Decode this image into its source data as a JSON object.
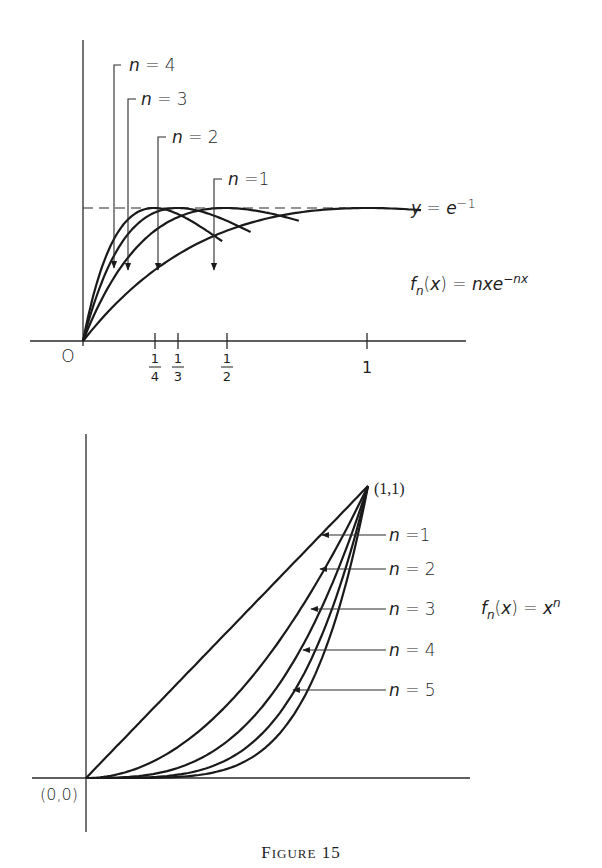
{
  "caption": "Figure 15",
  "top_plot": {
    "formula": "f_n(x) = nxe^{-nx}",
    "formula_parts": {
      "f": "f",
      "sub": "n",
      "rest": "(x) = nxe",
      "sup": "−nx"
    },
    "asymptote_label": {
      "pre": "y = e",
      "sup": "−1"
    },
    "origin_label": "O",
    "ticks": [
      {
        "num": "1",
        "den": "4",
        "x": 0.25
      },
      {
        "num": "1",
        "den": "3",
        "x": 0.3333
      },
      {
        "num": "1",
        "den": "2",
        "x": 0.5
      },
      {
        "label": "1",
        "x": 1
      }
    ],
    "curve_labels": [
      "n = 4",
      "n = 3",
      "n = 2",
      "n = 1"
    ]
  },
  "bottom_plot": {
    "formula_parts": {
      "f": "f",
      "sub": "n",
      "rest": "(x) = x",
      "sup": "n"
    },
    "origin_label": "(0,0)",
    "endpoint_label": "(1,1)",
    "curve_labels": [
      "n = 1",
      "n = 2",
      "n = 3",
      "n = 4",
      "n = 5"
    ]
  },
  "chart_data": [
    {
      "type": "line",
      "title": "f_n(x) = n x e^{-n x}",
      "xlabel": "x",
      "ylabel": "y",
      "x_ticks": [
        "1/4",
        "1/3",
        "1/2",
        "1"
      ],
      "xlim": [
        0,
        1.2
      ],
      "ylim": [
        0,
        0.9
      ],
      "grid": false,
      "annotations": [
        "y = e^-1 (dashed horizontal line at 0.3679)",
        "O at origin"
      ],
      "series": [
        {
          "name": "n = 1",
          "peak": [
            1,
            0.3679
          ],
          "x": [
            0,
            0.25,
            0.5,
            0.75,
            1.0,
            1.1
          ],
          "y": [
            0,
            0.1947,
            0.3033,
            0.3543,
            0.3679,
            0.3662
          ]
        },
        {
          "name": "n = 2",
          "peak": [
            0.5,
            0.3679
          ],
          "x": [
            0,
            0.25,
            0.5,
            0.75,
            0.95
          ],
          "y": [
            0,
            0.3033,
            0.3679,
            0.3347,
            0.2852
          ]
        },
        {
          "name": "n = 3",
          "peak": [
            0.3333,
            0.3679
          ],
          "x": [
            0,
            0.1667,
            0.3333,
            0.5,
            0.68
          ],
          "y": [
            0,
            0.3033,
            0.3679,
            0.3347,
            0.2648
          ]
        },
        {
          "name": "n = 4",
          "peak": [
            0.25,
            0.3679
          ],
          "x": [
            0,
            0.125,
            0.25,
            0.375,
            0.55
          ],
          "y": [
            0,
            0.3033,
            0.3679,
            0.3347,
            0.2437
          ]
        }
      ]
    },
    {
      "type": "line",
      "title": "f_n(x) = x^n",
      "xlabel": "x",
      "ylabel": "y",
      "xlim": [
        0,
        1
      ],
      "ylim": [
        0,
        1
      ],
      "grid": false,
      "annotations": [
        "(0,0)",
        "(1,1)"
      ],
      "series": [
        {
          "name": "n = 1",
          "x": [
            0,
            0.25,
            0.5,
            0.75,
            1
          ],
          "y": [
            0,
            0.25,
            0.5,
            0.75,
            1
          ]
        },
        {
          "name": "n = 2",
          "x": [
            0,
            0.25,
            0.5,
            0.75,
            1
          ],
          "y": [
            0,
            0.0625,
            0.25,
            0.5625,
            1
          ]
        },
        {
          "name": "n = 3",
          "x": [
            0,
            0.25,
            0.5,
            0.75,
            1
          ],
          "y": [
            0,
            0.0156,
            0.125,
            0.4219,
            1
          ]
        },
        {
          "name": "n = 4",
          "x": [
            0,
            0.25,
            0.5,
            0.75,
            1
          ],
          "y": [
            0,
            0.0039,
            0.0625,
            0.3164,
            1
          ]
        },
        {
          "name": "n = 5",
          "x": [
            0,
            0.25,
            0.5,
            0.75,
            1
          ],
          "y": [
            0,
            0.001,
            0.0313,
            0.2373,
            1
          ]
        }
      ]
    }
  ]
}
